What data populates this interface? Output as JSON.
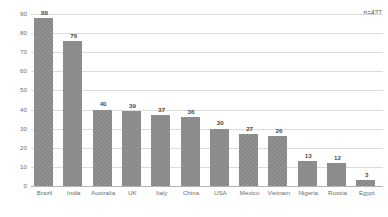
{
  "chart_data": {
    "type": "bar",
    "title": "",
    "subtitle": "",
    "xlabel": "",
    "ylabel": "",
    "ylim": [
      0,
      90
    ],
    "ytick_step": 10,
    "yticks": [
      "0",
      "10",
      "20",
      "30",
      "40",
      "50",
      "60",
      "70",
      "80",
      "90"
    ],
    "grid": true,
    "legend": "none",
    "categories": [
      "Brazil",
      "India",
      "Australia",
      "UK",
      "Italy",
      "China",
      "USA",
      "Mexico",
      "Vietnam",
      "Nigeria",
      "Russia",
      "Egypt"
    ],
    "values": [
      88,
      76,
      40,
      39,
      37,
      36,
      30,
      27,
      26,
      13,
      12,
      3
    ],
    "value_labels": [
      "88",
      "76",
      "40",
      "39",
      "37",
      "36",
      "30",
      "27",
      "26",
      "13",
      "12",
      "3"
    ],
    "annotations": [
      {
        "name": "sample-size",
        "text": "n=427"
      }
    ],
    "colors": {
      "bar_fill": "#8c8c8c",
      "gridline": "#dcdcdc",
      "axis_line": "#b4b4b4",
      "tick_label": "#6e6e6e",
      "value_label": "#4a4a4a",
      "background": "#ffffff"
    }
  }
}
